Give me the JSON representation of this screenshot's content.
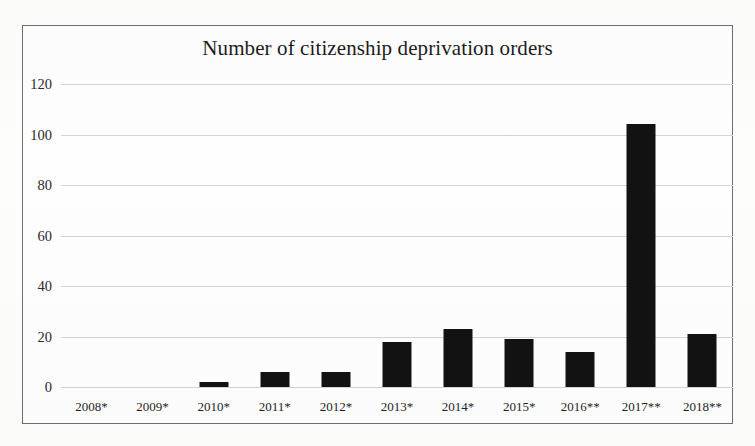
{
  "chart_data": {
    "type": "bar",
    "title": "Number of citizenship deprivation orders",
    "xlabel": "",
    "ylabel": "",
    "categories": [
      "2008*",
      "2009*",
      "2010*",
      "2011*",
      "2012*",
      "2013*",
      "2014*",
      "2015*",
      "2016**",
      "2017**",
      "2018**"
    ],
    "values": [
      0,
      0,
      2,
      6,
      6,
      18,
      23,
      19,
      14,
      104,
      21
    ],
    "ylim": [
      0,
      120
    ],
    "ytick_labels": [
      "0",
      "20",
      "40",
      "60",
      "80",
      "100",
      "120"
    ],
    "ytick_values": [
      0,
      20,
      40,
      60,
      80,
      100,
      120
    ],
    "grid": true,
    "legend": false,
    "series": [
      {
        "name": "Citizenship deprivation orders",
        "values": [
          0,
          0,
          2,
          6,
          6,
          18,
          23,
          19,
          14,
          104,
          21
        ]
      }
    ]
  },
  "colors": {
    "bar": "#121212",
    "gridline": "#d4d4d4",
    "frame_border": "#6f6f6f",
    "background": "#fefefe",
    "text": "#1c1c1c"
  }
}
